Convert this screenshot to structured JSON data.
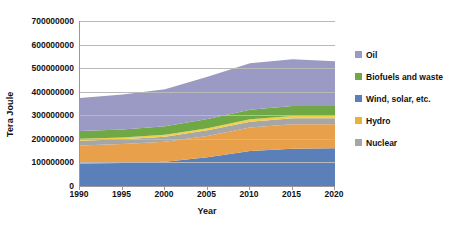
{
  "chart_data": {
    "type": "area",
    "title": "",
    "xlabel": "Year",
    "ylabel": "Tera Joule",
    "x": [
      1990,
      1995,
      2000,
      2005,
      2010,
      2015,
      2020
    ],
    "xlim": [
      1990,
      2020
    ],
    "ylim": [
      0,
      700000000
    ],
    "ytick_labels": [
      "700000000",
      "600000000",
      "500000000",
      "400000000",
      "300000000",
      "200000000",
      "100000000",
      "0"
    ],
    "ytick_values": [
      700000000,
      600000000,
      500000000,
      400000000,
      300000000,
      200000000,
      100000000,
      0
    ],
    "xtick_labels": [
      "1990",
      "1995",
      "2000",
      "2005",
      "2010",
      "2015",
      "2020"
    ],
    "grid": true,
    "stacked": true,
    "legend_position": "right",
    "stack_order_bottom_to_top": [
      "Wind, solar, etc.",
      "Hydro",
      "Nuclear",
      "Hydro",
      "Biofuels and waste",
      "Oil"
    ],
    "series": [
      {
        "name": "Oil",
        "color": "#9a9ac4",
        "legend_index": 0,
        "values": [
          140000000,
          148000000,
          157000000,
          180000000,
          197000000,
          199000000,
          190000000
        ]
      },
      {
        "name": "Biofuels and waste",
        "color": "#70a845",
        "legend_index": 1,
        "values": [
          33000000,
          34000000,
          36000000,
          39000000,
          41000000,
          42000000,
          42000000
        ]
      },
      {
        "name": "Wind, solar, etc.",
        "color": "#5b7fb9",
        "legend_index": 2,
        "values": [
          7000000,
          7500000,
          8000000,
          9000000,
          10000000,
          11000000,
          11000000
        ]
      },
      {
        "name": "Hydro",
        "color": "#e8b33a",
        "legend_index": 3,
        "values": [
          5000000,
          5200000,
          5500000,
          6000000,
          6500000,
          7000000,
          7000000
        ]
      },
      {
        "name": "Nuclear",
        "color": "#a6a6a6",
        "legend_index": 4,
        "values": [
          18000000,
          19000000,
          20000000,
          22000000,
          24000000,
          25000000,
          25000000
        ]
      }
    ],
    "stack_bands": [
      {
        "name": "Wind, solar, etc.",
        "color": "#5b7fb9",
        "baseline": [
          0,
          0,
          0,
          0,
          0,
          0,
          0
        ],
        "top": [
          95000000,
          98000000,
          103000000,
          122000000,
          148000000,
          158000000,
          160000000
        ]
      },
      {
        "name": "Hydro",
        "color": "#e8a04a",
        "baseline": [
          95000000,
          98000000,
          103000000,
          122000000,
          148000000,
          158000000,
          160000000
        ],
        "top": [
          172000000,
          178000000,
          188000000,
          212000000,
          248000000,
          262000000,
          262000000
        ]
      },
      {
        "name": "Nuclear",
        "color": "#a6a6a6",
        "baseline": [
          172000000,
          178000000,
          188000000,
          212000000,
          248000000,
          262000000,
          262000000
        ],
        "top": [
          192000000,
          198000000,
          209000000,
          236000000,
          273000000,
          287000000,
          287000000
        ]
      },
      {
        "name": "Hydro-thin",
        "color": "#f2d14a",
        "baseline": [
          192000000,
          198000000,
          209000000,
          236000000,
          273000000,
          287000000,
          287000000
        ],
        "top": [
          200000000,
          206000000,
          217000000,
          245000000,
          283000000,
          297000000,
          297000000
        ]
      },
      {
        "name": "Biofuels and waste",
        "color": "#70a845",
        "baseline": [
          200000000,
          206000000,
          217000000,
          245000000,
          283000000,
          297000000,
          297000000
        ],
        "top": [
          233000000,
          240000000,
          253000000,
          284000000,
          324000000,
          339000000,
          339000000
        ]
      },
      {
        "name": "Oil",
        "color": "#9a9ac4",
        "baseline": [
          233000000,
          240000000,
          253000000,
          284000000,
          324000000,
          339000000,
          339000000
        ],
        "top": [
          373000000,
          388000000,
          410000000,
          464000000,
          521000000,
          538000000,
          529000000
        ]
      }
    ],
    "total_values": [
      373000000,
      388000000,
      410000000,
      464000000,
      521000000,
      538000000,
      529000000
    ]
  },
  "legend": {
    "items": [
      {
        "label": "Oil",
        "color": "#9a9ac4"
      },
      {
        "label": "Biofuels and waste",
        "color": "#70a845"
      },
      {
        "label": "Wind, solar, etc.",
        "color": "#5b7fb9"
      },
      {
        "label": "Hydro",
        "color": "#e8b33a"
      },
      {
        "label": "Nuclear",
        "color": "#a6a6a6"
      }
    ]
  },
  "axes": {
    "y_title": "Tera Joule",
    "x_title": "Year"
  }
}
